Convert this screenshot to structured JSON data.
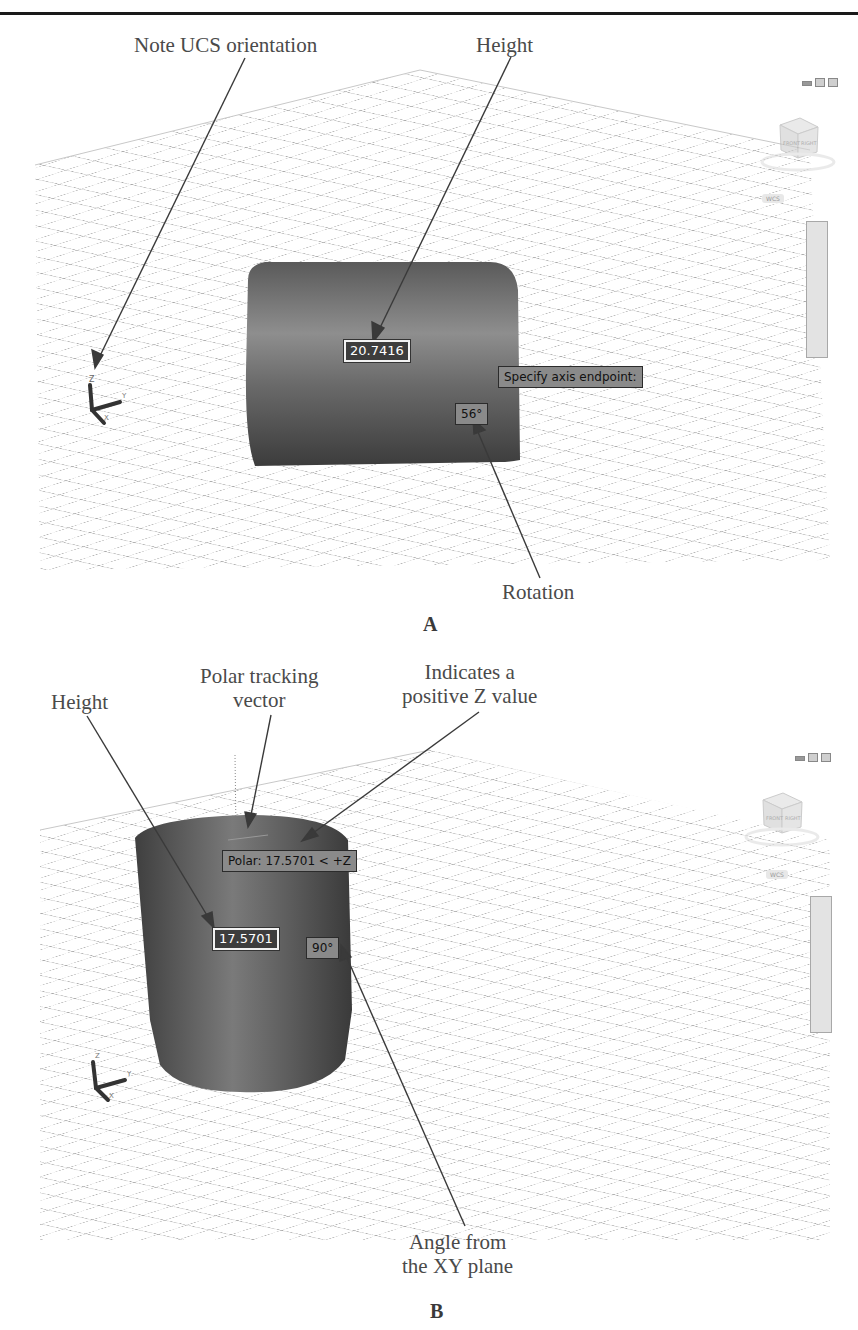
{
  "panel_a": {
    "letter": "A",
    "callouts": {
      "ucs": "Note UCS orientation",
      "height": "Height",
      "rotation": "Rotation"
    },
    "dynamic_input": {
      "height_value": "20.7416",
      "prompt": "Specify axis endpoint:",
      "angle": "56°"
    },
    "viewcube": {
      "faces": [
        "FRONT",
        "RIGHT"
      ],
      "coord_label": "WCS"
    },
    "ucs_icon": {
      "axes": [
        "Z",
        "Y",
        "X"
      ]
    },
    "window_controls": [
      "minimize",
      "restore",
      "close"
    ]
  },
  "panel_b": {
    "letter": "B",
    "callouts": {
      "height": "Height",
      "polar_line1": "Polar tracking",
      "polar_line2": "vector",
      "positive_z_line1": "Indicates a",
      "positive_z_line2": "positive Z value",
      "angle_line1": "Angle from",
      "angle_line2": "the XY plane"
    },
    "dynamic_input": {
      "height_value": "17.5701",
      "polar_tooltip": "Polar: 17.5701 < +Z",
      "angle": "90°"
    },
    "viewcube": {
      "faces": [
        "FRONT",
        "RIGHT"
      ],
      "coord_label": "WCS"
    },
    "ucs_icon": {
      "axes": [
        "Z",
        "Y",
        "X"
      ]
    },
    "window_controls": [
      "minimize",
      "restore",
      "close"
    ]
  },
  "colors": {
    "cylinder_dark": "#3e3e3e",
    "cylinder_light": "#8c8c8c",
    "grid": "#b5b5b5",
    "callout_text": "#4a4a4a",
    "leader": "#3a3a3a"
  }
}
